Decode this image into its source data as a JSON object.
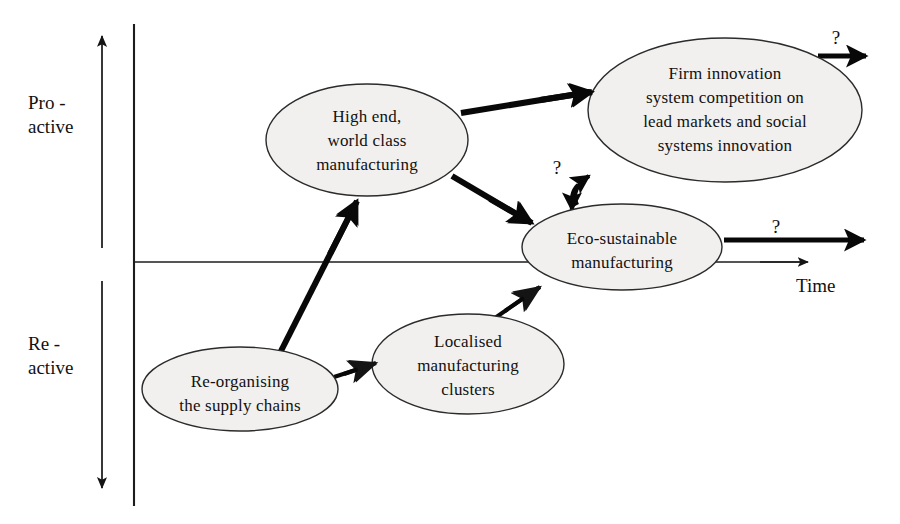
{
  "diagram": {
    "background_color": "#ffffff",
    "node_fill_color": "#f1f0ee",
    "node_stroke_color": "#2b2b2b",
    "arrow_color": "#080808",
    "axes": {
      "vertical_axis_name": "proactive-reactive-axis",
      "upper_label_line1": "Pro -",
      "upper_label_line2": "active",
      "lower_label_line1": "Re -",
      "lower_label_line2": "active",
      "horizontal_axis_label": "Time"
    },
    "nodes": [
      {
        "id": "high-end",
        "lines": [
          "High end,",
          "world class",
          "manufacturing"
        ],
        "cx": 367,
        "cy": 140,
        "rx": 101,
        "ry": 56
      },
      {
        "id": "firm-innovation",
        "lines": [
          "Firm innovation",
          "system competition on",
          "lead markets and social",
          "systems innovation"
        ],
        "cx": 725,
        "cy": 110,
        "rx": 137,
        "ry": 72
      },
      {
        "id": "eco-sustainable",
        "lines": [
          "Eco-sustainable",
          "manufacturing"
        ],
        "cx": 622,
        "cy": 247,
        "rx": 100,
        "ry": 43
      },
      {
        "id": "localised-clusters",
        "lines": [
          "Localised",
          "manufacturing",
          "clusters"
        ],
        "cx": 468,
        "cy": 364,
        "rx": 96,
        "ry": 50
      },
      {
        "id": "re-organising",
        "lines": [
          "Re-organising",
          "the supply chains"
        ],
        "cx": 240,
        "cy": 389,
        "rx": 98,
        "ry": 42
      }
    ],
    "connections": [
      {
        "id": "reorg-to-clusters",
        "from": "re-organising",
        "to": "localised-clusters",
        "label": ""
      },
      {
        "id": "reorg-to-highend",
        "from": "re-organising",
        "to": "high-end",
        "label": ""
      },
      {
        "id": "clusters-to-eco",
        "from": "localised-clusters",
        "to": "eco-sustainable",
        "label": ""
      },
      {
        "id": "highend-to-firm",
        "from": "high-end",
        "to": "firm-innovation",
        "label": ""
      },
      {
        "id": "highend-to-eco",
        "from": "high-end",
        "to": "eco-sustainable",
        "label": ""
      },
      {
        "id": "eco-firm-bidirectional",
        "from": "eco-sustainable",
        "to": "firm-innovation",
        "label": "?"
      },
      {
        "id": "firm-future",
        "from": "firm-innovation",
        "to": "future",
        "label": "?"
      },
      {
        "id": "eco-future",
        "from": "eco-sustainable",
        "to": "future",
        "label": "?"
      }
    ],
    "question_marks": [
      {
        "id": "qmark-firm-future",
        "text": "?",
        "x": 836,
        "y": 44
      },
      {
        "id": "qmark-eco-firm",
        "text": "?",
        "x": 557,
        "y": 174
      },
      {
        "id": "qmark-eco-future",
        "text": "?",
        "x": 776,
        "y": 233
      }
    ]
  }
}
